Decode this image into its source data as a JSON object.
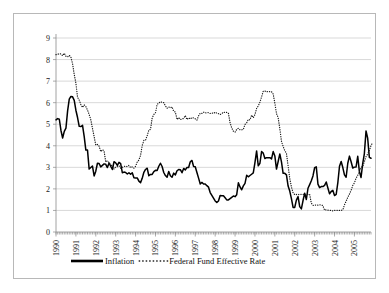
{
  "chart_data": {
    "type": "line",
    "title": "",
    "xlabel": "",
    "ylabel": "",
    "ylim": [
      0,
      9
    ],
    "yticks": [
      0,
      1,
      2,
      3,
      4,
      5,
      6,
      7,
      8,
      9
    ],
    "grid": true,
    "legend_position": "bottom",
    "xtick_labels": [
      "1990",
      "1991",
      "1992",
      "1993",
      "1994",
      "1995",
      "1996",
      "1997",
      "1998",
      "1999",
      "2000",
      "2001",
      "2002",
      "2003",
      "2004",
      "2005"
    ],
    "x_start": 1990.0,
    "x_end": 2005.92,
    "x_step_months": 1,
    "series": [
      {
        "name": "Inflation",
        "style": "solid",
        "color": "#000000",
        "values": [
          5.2,
          5.26,
          5.23,
          4.71,
          4.36,
          4.67,
          4.82,
          5.62,
          6.16,
          6.29,
          6.27,
          6.11,
          5.65,
          5.31,
          4.9,
          4.89,
          4.95,
          4.44,
          3.8,
          3.8,
          2.92,
          2.99,
          3.06,
          2.6,
          2.82,
          3.19,
          3.18,
          3.02,
          3.09,
          3.16,
          3.14,
          2.99,
          3.2,
          3.05,
          2.9,
          3.26,
          3.21,
          3.09,
          3.23,
          3.17,
          2.75,
          2.78,
          2.76,
          2.69,
          2.75,
          2.68,
          2.75,
          2.52,
          2.51,
          2.51,
          2.36,
          2.29,
          2.49,
          2.77,
          2.9,
          2.96,
          2.61,
          2.67,
          2.67,
          2.8,
          2.86,
          2.85,
          3.05,
          3.19,
          3.04,
          2.76,
          2.62,
          2.54,
          2.81,
          2.61,
          2.54,
          2.73,
          2.65,
          2.84,
          2.9,
          2.89,
          2.75,
          2.95,
          2.88,
          2.99,
          2.99,
          3.26,
          3.32,
          3.04,
          3.03,
          2.76,
          2.5,
          2.23,
          2.3,
          2.23,
          2.23,
          2.15,
          2.08,
          1.83,
          1.7,
          1.57,
          1.44,
          1.37,
          1.44,
          1.69,
          1.68,
          1.68,
          1.59,
          1.49,
          1.49,
          1.55,
          1.61,
          1.67,
          1.64,
          1.73,
          2.28,
          2.09,
          1.96,
          2.14,
          2.26,
          2.63,
          2.56,
          2.62,
          2.68,
          2.74,
          3.22,
          3.76,
          3.07,
          3.19,
          3.73,
          3.66,
          3.41,
          3.45,
          3.45,
          3.45,
          3.39,
          3.73,
          3.53,
          2.92,
          3.27,
          3.62,
          3.25,
          2.72,
          2.72,
          2.65,
          2.13,
          1.9,
          1.55,
          1.14,
          1.14,
          1.48,
          1.64,
          1.18,
          1.07,
          1.46,
          1.8,
          1.51,
          2.03,
          2.2,
          2.38,
          2.6,
          2.98,
          3.02,
          2.22,
          2.06,
          2.11,
          2.11,
          2.16,
          2.32,
          2.04,
          1.77,
          1.88,
          1.93,
          1.69,
          1.74,
          2.29,
          3.05,
          3.27,
          2.99,
          2.65,
          2.54,
          3.19,
          3.52,
          3.26,
          2.97,
          3.01,
          3.02,
          3.51,
          2.8,
          2.53,
          3.17,
          3.64,
          4.69,
          4.35,
          3.46,
          3.42
        ]
      },
      {
        "name": "Federal Fund Effective Rate",
        "style": "dotted",
        "color": "#1a1a1a",
        "values": [
          8.23,
          8.24,
          8.28,
          8.26,
          8.18,
          8.29,
          8.15,
          8.13,
          8.2,
          8.11,
          7.81,
          7.31,
          6.91,
          6.25,
          6.12,
          5.91,
          5.78,
          5.9,
          5.82,
          5.66,
          5.45,
          5.21,
          4.81,
          4.43,
          4.03,
          4.06,
          3.98,
          3.73,
          3.82,
          3.76,
          3.25,
          3.3,
          3.22,
          3.1,
          3.09,
          2.92,
          3.02,
          3.03,
          3.07,
          2.96,
          3.0,
          3.04,
          3.06,
          3.03,
          3.09,
          2.99,
          3.02,
          2.96,
          3.05,
          3.25,
          3.34,
          3.56,
          4.01,
          4.25,
          4.26,
          4.47,
          4.73,
          4.76,
          5.29,
          5.45,
          5.53,
          5.92,
          5.98,
          6.05,
          6.01,
          6.0,
          5.85,
          5.74,
          5.8,
          5.76,
          5.8,
          5.6,
          5.56,
          5.22,
          5.31,
          5.22,
          5.24,
          5.27,
          5.4,
          5.22,
          5.3,
          5.24,
          5.31,
          5.29,
          5.25,
          5.19,
          5.39,
          5.51,
          5.5,
          5.56,
          5.52,
          5.54,
          5.54,
          5.5,
          5.52,
          5.5,
          5.56,
          5.51,
          5.49,
          5.45,
          5.49,
          5.56,
          5.54,
          5.55,
          5.51,
          5.07,
          4.83,
          4.68,
          4.63,
          4.76,
          4.81,
          4.74,
          4.74,
          4.76,
          4.99,
          5.07,
          5.22,
          5.2,
          5.42,
          5.3,
          5.45,
          5.73,
          5.85,
          6.02,
          6.27,
          6.53,
          6.54,
          6.5,
          6.52,
          6.51,
          6.51,
          6.4,
          5.98,
          5.49,
          5.31,
          4.8,
          4.21,
          3.97,
          3.77,
          3.65,
          3.07,
          2.49,
          2.09,
          1.82,
          1.73,
          1.74,
          1.73,
          1.75,
          1.75,
          1.75,
          1.73,
          1.74,
          1.75,
          1.75,
          1.34,
          1.24,
          1.24,
          1.26,
          1.25,
          1.26,
          1.26,
          1.22,
          1.01,
          1.03,
          1.01,
          1.01,
          1.0,
          0.98,
          1.0,
          1.01,
          1.0,
          1.0,
          1.0,
          1.03,
          1.26,
          1.43,
          1.61,
          1.76,
          1.93,
          2.16,
          2.28,
          2.5,
          2.63,
          2.79,
          3.0,
          3.04,
          3.26,
          3.5,
          3.62,
          3.78,
          4.0,
          4.16
        ]
      }
    ]
  },
  "legend": {
    "items": [
      {
        "label": "Inflation",
        "style": "solid"
      },
      {
        "label": "Federal Fund Effective Rate",
        "style": "dotted"
      }
    ]
  }
}
